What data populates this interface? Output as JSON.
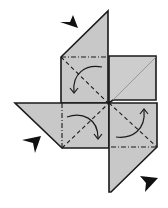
{
  "diagram": {
    "colors": {
      "paper": "#c8c8c8",
      "paper_light": "#d4d4d4",
      "line": "#1a1a1a",
      "background": "#ffffff"
    },
    "elements": {
      "top_flap": "top-triangle-flap",
      "left_flap": "left-triangle-flap",
      "bottom_flap": "bottom-triangle-flap",
      "upper_right_square": "upper-right-square",
      "fold_arrows": 4,
      "push_arrows": 3
    }
  }
}
